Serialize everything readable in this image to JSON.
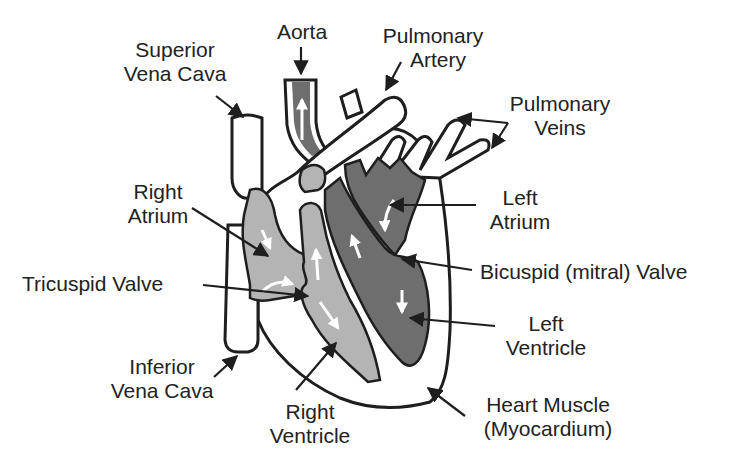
{
  "colors": {
    "outline": "#1e1e1e",
    "oxygen_poor_fill": "#b4b4b4",
    "oxygen_rich_fill": "#6e6e6e",
    "vessel_fill": "#ffffff",
    "flow_arrow": "#ffffff",
    "label_text": "#222222"
  },
  "labels": {
    "superior_vena_cava": {
      "line1": "Superior",
      "line2": "Vena Cava"
    },
    "aorta": {
      "line1": "Aorta"
    },
    "pulmonary_artery": {
      "line1": "Pulmonary",
      "line2": "Artery"
    },
    "pulmonary_veins": {
      "line1": "Pulmonary",
      "line2": "Veins"
    },
    "right_atrium": {
      "line1": "Right",
      "line2": "Atrium"
    },
    "left_atrium": {
      "line1": "Left",
      "line2": "Atrium"
    },
    "tricuspid_valve": {
      "line1": "Tricuspid Valve"
    },
    "bicuspid_valve": {
      "line1": "Bicuspid (mitral) Valve"
    },
    "left_ventricle": {
      "line1": "Left",
      "line2": "Ventricle"
    },
    "inferior_vena_cava": {
      "line1": "Inferior",
      "line2": "Vena Cava"
    },
    "right_ventricle": {
      "line1": "Right",
      "line2": "Ventricle"
    },
    "heart_muscle": {
      "line1": "Heart Muscle",
      "line2": "(Myocardium)"
    }
  }
}
